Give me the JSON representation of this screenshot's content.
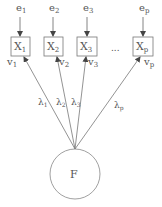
{
  "diagram": {
    "type": "factor-model",
    "factor": {
      "label": "F",
      "cx": 75,
      "cy": 174,
      "r": 25
    },
    "indicators": [
      {
        "id": "x1",
        "label": "X",
        "sub": "1",
        "error": "e",
        "error_sub": "1",
        "resid": "v",
        "resid_sub": "1",
        "loading": "λ",
        "loading_sub": "1",
        "box_x": 11,
        "target_x": 24
      },
      {
        "id": "x2",
        "label": "X",
        "sub": "2",
        "error": "e",
        "error_sub": "2",
        "resid": "v",
        "resid_sub": "2",
        "loading": "λ",
        "loading_sub": "2",
        "box_x": 44,
        "target_x": 57
      },
      {
        "id": "x3",
        "label": "X",
        "sub": "3",
        "error": "e",
        "error_sub": "3",
        "resid": "v",
        "resid_sub": "3",
        "loading": "λ",
        "loading_sub": "3",
        "box_x": 77,
        "target_x": 85
      },
      {
        "id": "xp",
        "label": "X",
        "sub": "p",
        "error": "e",
        "error_sub": "p",
        "resid": "v",
        "resid_sub": "p",
        "loading": "λ",
        "loading_sub": "p",
        "box_x": 133,
        "target_x": 139
      }
    ],
    "ellipsis": "...",
    "colors": {
      "stroke": "#777777",
      "text": "#555555",
      "background": "#ffffff"
    }
  }
}
